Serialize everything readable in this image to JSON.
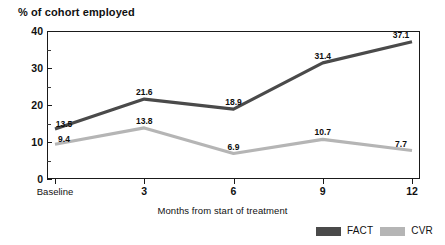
{
  "chart_data": {
    "type": "line",
    "title": "% of cohort employed",
    "xlabel": "Months from start of treatment",
    "ylabel": "",
    "categories": [
      "Baseline",
      "3",
      "6",
      "9",
      "12"
    ],
    "x": [
      0,
      3,
      6,
      9,
      12
    ],
    "ylim": [
      0,
      40
    ],
    "xlim": [
      0,
      12
    ],
    "yticks": [
      0,
      10,
      20,
      30,
      40
    ],
    "yticklabels": [
      "0",
      "10",
      "20",
      "30",
      "40"
    ],
    "yminorticks": [
      5,
      15,
      25,
      35
    ],
    "xticklabels": [
      "Baseline",
      "3",
      "6",
      "9",
      "12"
    ],
    "grid": false,
    "legend_position": "bottom-right",
    "series": [
      {
        "name": "FACT",
        "color": "#4a4a4a",
        "values": [
          13.5,
          21.6,
          18.9,
          31.4,
          37.1
        ],
        "labels": [
          "13.5",
          "21.6",
          "18.9",
          "31.4",
          "37.1"
        ]
      },
      {
        "name": "CVR",
        "color": "#b5b5b5",
        "values": [
          9.4,
          13.8,
          6.9,
          10.7,
          7.7
        ],
        "labels": [
          "9.4",
          "13.8",
          "6.9",
          "10.7",
          "7.7"
        ]
      }
    ]
  },
  "legend": {
    "items": [
      {
        "label": "FACT",
        "color": "#4a4a4a"
      },
      {
        "label": "CVR",
        "color": "#b5b5b5"
      }
    ]
  },
  "colors": {
    "fact": "#4a4a4a",
    "cvr": "#b5b5b5",
    "axis": "#1a1a1a",
    "text": "#111111",
    "background": "#ffffff"
  }
}
